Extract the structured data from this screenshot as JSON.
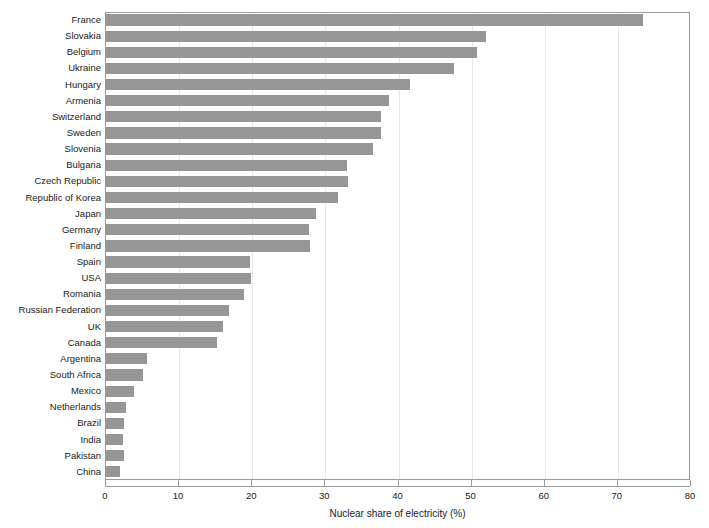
{
  "chart_data": {
    "type": "bar",
    "orientation": "horizontal",
    "title": "",
    "subtitle": "",
    "xlabel": "Nuclear share of electricity (%)",
    "ylabel": "",
    "xlim": [
      0,
      80
    ],
    "xticks": [
      0,
      10,
      20,
      30,
      40,
      50,
      60,
      70,
      80
    ],
    "grid": true,
    "grid_axis": "x",
    "legend": null,
    "bar_color": "#969696",
    "frame_color": "#9a9a9a",
    "gridline_color": "#e8e8e8",
    "categories": [
      "France",
      "Slovakia",
      "Belgium",
      "Ukraine",
      "Hungary",
      "Armenia",
      "Switzerland",
      "Sweden",
      "Slovenia",
      "Bulgaria",
      "Czech Republic",
      "Republic of Korea",
      "Japan",
      "Germany",
      "Finland",
      "Spain",
      "USA",
      "Romania",
      "Russian Federation",
      "UK",
      "Canada",
      "Argentina",
      "South Africa",
      "Mexico",
      "Netherlands",
      "Brazil",
      "India",
      "Pakistan",
      "China"
    ],
    "values": [
      73.6,
      52.1,
      50.9,
      47.7,
      41.7,
      38.8,
      37.8,
      37.7,
      36.7,
      33.1,
      33.2,
      31.9,
      28.9,
      27.9,
      28.0,
      19.8,
      19.9,
      19.0,
      17.0,
      16.2,
      15.3,
      5.8,
      5.2,
      3.9,
      2.9,
      2.6,
      2.5,
      2.6,
      2.1
    ]
  }
}
